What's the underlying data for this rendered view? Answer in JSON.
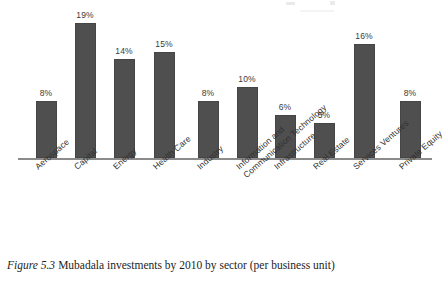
{
  "caption": {
    "figure_number": "Figure 5.3",
    "text": "Mubadala investments by 2010 by sector (per business unit)"
  },
  "colors": {
    "bar": "#4f4f4f",
    "axis": "#8b8b8b",
    "text": "#2f2f2f",
    "background": "#ffffff"
  },
  "chart_data": {
    "type": "bar",
    "title": "Mubadala investments by 2010 by sector (per business unit)",
    "xlabel": "",
    "ylabel": "",
    "ylim": [
      0,
      20
    ],
    "grid": false,
    "legend": "none",
    "value_suffix": "%",
    "categories": [
      "Aerospace",
      "Capital",
      "Energy",
      "Health Care",
      "Industry",
      "Information and Communication Technology",
      "Infrastructure",
      "Real Estate",
      "Services Ventures",
      "Private Equity"
    ],
    "category_lines": [
      [
        "Aerospace"
      ],
      [
        "Capital"
      ],
      [
        "Energy"
      ],
      [
        "Health Care"
      ],
      [
        "Industry"
      ],
      [
        "Information and",
        "Communication Technology"
      ],
      [
        "Infrastructure"
      ],
      [
        "Real Estate"
      ],
      [
        "Services Ventures"
      ],
      [
        "Private Equity"
      ]
    ],
    "values": [
      8,
      19,
      14,
      15,
      8,
      10,
      6,
      5,
      16,
      8
    ],
    "value_labels": [
      "8%",
      "19%",
      "14%",
      "15%",
      "8%",
      "10%",
      "6%",
      "5%",
      "16%",
      "8%"
    ]
  }
}
